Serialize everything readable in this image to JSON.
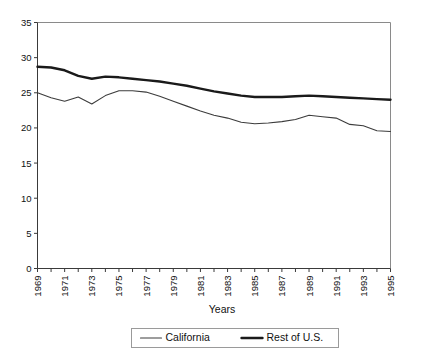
{
  "chart_data": {
    "type": "line",
    "title": "",
    "xlabel": "Years",
    "ylabel": "",
    "xlim": [
      1969,
      1995
    ],
    "ylim": [
      0,
      35
    ],
    "ytick_step": 5,
    "yticks": [
      0,
      5,
      10,
      15,
      20,
      25,
      30,
      35
    ],
    "ytick_labels": [
      "0",
      "5",
      "10",
      "15",
      "20",
      "25",
      "30",
      "35"
    ],
    "x": [
      1969,
      1970,
      1971,
      1972,
      1973,
      1974,
      1975,
      1976,
      1977,
      1978,
      1979,
      1980,
      1981,
      1982,
      1983,
      1984,
      1985,
      1986,
      1987,
      1988,
      1989,
      1990,
      1991,
      1992,
      1993,
      1994,
      1995
    ],
    "xtick_labels": [
      "1969",
      "1971",
      "1973",
      "1975",
      "1977",
      "1979",
      "1981",
      "1983",
      "1985",
      "1987",
      "1989",
      "1991",
      "1993",
      "1995"
    ],
    "xtick_label_years": [
      1969,
      1971,
      1973,
      1975,
      1977,
      1979,
      1981,
      1983,
      1985,
      1987,
      1989,
      1991,
      1993,
      1995
    ],
    "grid": false,
    "legend_position": "bottom",
    "series": [
      {
        "name": "California",
        "style": "thin",
        "color": "#3c3c3c",
        "values": [
          25.0,
          24.3,
          23.8,
          24.4,
          23.4,
          24.6,
          25.3,
          25.3,
          25.1,
          24.5,
          23.8,
          23.1,
          22.4,
          21.8,
          21.4,
          20.8,
          20.6,
          20.7,
          20.9,
          21.2,
          21.8,
          21.6,
          21.4,
          20.5,
          20.3,
          19.6,
          19.5
        ]
      },
      {
        "name": "Rest of U.S.",
        "style": "thick",
        "color": "#1a1a1a",
        "values": [
          28.7,
          28.6,
          28.2,
          27.4,
          27.0,
          27.3,
          27.2,
          27.0,
          26.8,
          26.6,
          26.3,
          26.0,
          25.6,
          25.2,
          24.9,
          24.6,
          24.4,
          24.4,
          24.4,
          24.5,
          24.6,
          24.5,
          24.4,
          24.3,
          24.2,
          24.1,
          24.0
        ]
      }
    ]
  },
  "axis_title": {
    "x": "Years"
  },
  "legend": {
    "items": [
      {
        "label": "California",
        "style": "thin"
      },
      {
        "label": "Rest of U.S.",
        "style": "thick"
      }
    ]
  }
}
